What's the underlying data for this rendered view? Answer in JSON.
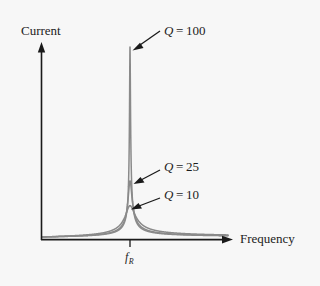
{
  "figure": {
    "background_color": "#f7f7f7",
    "axis_color": "#1a1a1a",
    "curve_color": "#8a8a8a",
    "ylabel": "Current",
    "xlabel": "Frequency",
    "resonance_tick_symbol": "f",
    "resonance_tick_subscript": "R"
  },
  "annotations": [
    {
      "symbol": "Q",
      "equals": " = ",
      "value": "100"
    },
    {
      "symbol": "Q",
      "equals": " = ",
      "value": "25"
    },
    {
      "symbol": "Q",
      "equals": " = ",
      "value": "10"
    }
  ],
  "chart_data": {
    "type": "line",
    "title": "",
    "xlabel": "Frequency",
    "ylabel": "Current",
    "xlim": [
      0,
      2
    ],
    "ylim": [
      0,
      1
    ],
    "grid": false,
    "legend": "annotated-arrows",
    "x_tick_labels": [
      "f_R"
    ],
    "x_tick_values": [
      1.0
    ],
    "y_tick_labels": [],
    "resonant_frequency": 1.0,
    "series": [
      {
        "name": "Q = 100",
        "q": 100,
        "peak_current_relative": 1.0,
        "peak_frequency": 1.0,
        "bandwidth_relative": 0.01,
        "color": "#8a8a8a"
      },
      {
        "name": "Q = 25",
        "q": 25,
        "peak_current_relative": 0.295,
        "peak_frequency": 1.0,
        "bandwidth_relative": 0.04,
        "color": "#8a8a8a"
      },
      {
        "name": "Q = 10",
        "q": 10,
        "peak_current_relative": 0.165,
        "peak_frequency": 1.0,
        "bandwidth_relative": 0.1,
        "color": "#8a8a8a"
      }
    ]
  }
}
